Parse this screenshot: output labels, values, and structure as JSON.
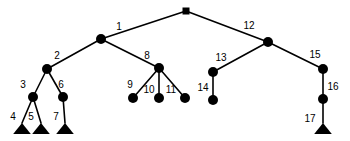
{
  "figure": {
    "width": 350,
    "height": 141,
    "background_color": "#ffffff",
    "ink_color": "#000000"
  },
  "chart_data": {
    "type": "diagram",
    "diagram_kind": "tree",
    "xlabel": "",
    "ylabel": "",
    "grid": false,
    "legend": false,
    "node_shapes": {
      "root": "square",
      "internal": "filled-circle",
      "leaf_subtree": "filled-triangle"
    },
    "nodes": [
      {
        "id": "root",
        "label": "",
        "shape": "square",
        "x": 186,
        "y": 11,
        "size": 7,
        "label_x": 186,
        "label_y": 11
      },
      {
        "id": "n1",
        "label": "1",
        "shape": "circle",
        "x": 101,
        "y": 39,
        "size": 5,
        "label_x": 119,
        "label_y": 27
      },
      {
        "id": "n2",
        "label": "2",
        "shape": "circle",
        "x": 47,
        "y": 69,
        "size": 5,
        "label_x": 57,
        "label_y": 56
      },
      {
        "id": "n3",
        "label": "3",
        "shape": "circle",
        "x": 33,
        "y": 97,
        "size": 5,
        "label_x": 23,
        "label_y": 85
      },
      {
        "id": "n4",
        "label": "4",
        "shape": "triangle",
        "x": 22,
        "y": 134,
        "size": 11,
        "label_x": 13,
        "label_y": 117
      },
      {
        "id": "n5",
        "label": "5",
        "shape": "triangle",
        "x": 41,
        "y": 134,
        "size": 11,
        "label_x": 31,
        "label_y": 117
      },
      {
        "id": "n6",
        "label": "6",
        "shape": "circle",
        "x": 63,
        "y": 97,
        "size": 5,
        "label_x": 61,
        "label_y": 85
      },
      {
        "id": "n7",
        "label": "7",
        "shape": "triangle",
        "x": 65,
        "y": 134,
        "size": 11,
        "label_x": 56,
        "label_y": 117
      },
      {
        "id": "n8",
        "label": "8",
        "shape": "circle",
        "x": 159,
        "y": 68,
        "size": 5,
        "label_x": 147,
        "label_y": 56
      },
      {
        "id": "n9",
        "label": "9",
        "shape": "circle",
        "x": 133,
        "y": 98,
        "size": 5,
        "label_x": 130,
        "label_y": 85
      },
      {
        "id": "n10",
        "label": "10",
        "shape": "circle",
        "x": 159,
        "y": 98,
        "size": 5,
        "label_x": 149,
        "label_y": 90
      },
      {
        "id": "n11",
        "label": "11",
        "shape": "circle",
        "x": 185,
        "y": 98,
        "size": 5,
        "label_x": 171,
        "label_y": 90
      },
      {
        "id": "n12",
        "label": "12",
        "shape": "circle",
        "x": 268,
        "y": 42,
        "size": 5,
        "label_x": 249,
        "label_y": 26
      },
      {
        "id": "n13",
        "label": "13",
        "shape": "circle",
        "x": 213,
        "y": 72,
        "size": 5,
        "label_x": 221,
        "label_y": 58
      },
      {
        "id": "n14",
        "label": "14",
        "shape": "circle",
        "x": 213,
        "y": 100,
        "size": 5,
        "label_x": 203,
        "label_y": 88
      },
      {
        "id": "n15",
        "label": "15",
        "shape": "circle",
        "x": 323,
        "y": 69,
        "size": 5,
        "label_x": 315,
        "label_y": 55
      },
      {
        "id": "n16",
        "label": "16",
        "shape": "circle",
        "x": 323,
        "y": 99,
        "size": 5,
        "label_x": 333,
        "label_y": 87
      },
      {
        "id": "n17",
        "label": "17",
        "shape": "triangle",
        "x": 323,
        "y": 134,
        "size": 11,
        "label_x": 310,
        "label_y": 119
      }
    ],
    "edges": [
      {
        "from": "root",
        "to": "n1"
      },
      {
        "from": "root",
        "to": "n12"
      },
      {
        "from": "n1",
        "to": "n2"
      },
      {
        "from": "n1",
        "to": "n8"
      },
      {
        "from": "n2",
        "to": "n3"
      },
      {
        "from": "n2",
        "to": "n6"
      },
      {
        "from": "n3",
        "to": "n4"
      },
      {
        "from": "n3",
        "to": "n5"
      },
      {
        "from": "n6",
        "to": "n7"
      },
      {
        "from": "n8",
        "to": "n9"
      },
      {
        "from": "n8",
        "to": "n10"
      },
      {
        "from": "n8",
        "to": "n11"
      },
      {
        "from": "n12",
        "to": "n13"
      },
      {
        "from": "n12",
        "to": "n15"
      },
      {
        "from": "n13",
        "to": "n14"
      },
      {
        "from": "n15",
        "to": "n16"
      },
      {
        "from": "n16",
        "to": "n17"
      }
    ],
    "labels": [
      "1",
      "2",
      "3",
      "4",
      "5",
      "6",
      "7",
      "8",
      "9",
      "10",
      "11",
      "12",
      "13",
      "14",
      "15",
      "16",
      "17"
    ]
  }
}
